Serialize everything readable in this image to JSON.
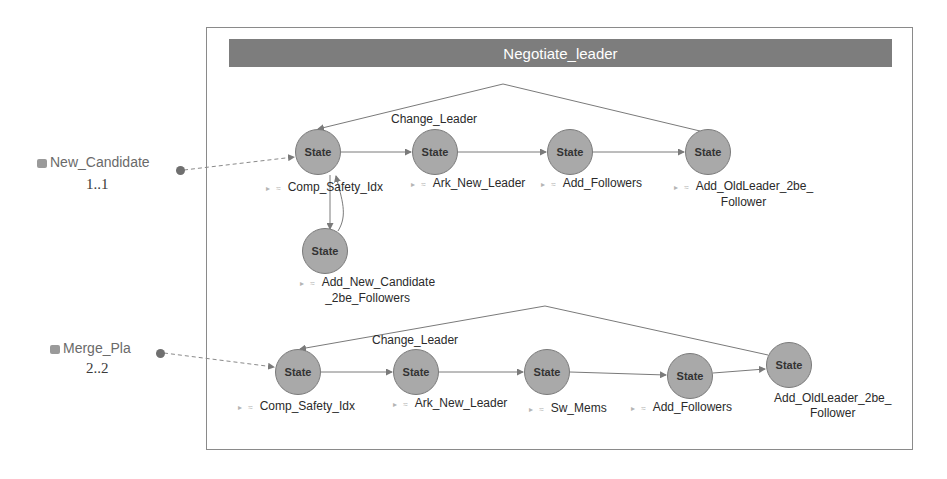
{
  "diagram": {
    "title": "Negotiate_leader",
    "colors": {
      "title_bar": "#7d7d7d",
      "state_fill": "#a9a9a9",
      "edge": "#7a7a7a",
      "frame": "#8a8a8a"
    },
    "ports": [
      {
        "name": "New_Candidate",
        "multiplicity": "1..1"
      },
      {
        "name": "Merge_Pla",
        "multiplicity": "2..2"
      }
    ],
    "top_row": {
      "edge_label": "Change_Leader",
      "states": [
        {
          "text": "State",
          "label": "Comp_Safety_Idx"
        },
        {
          "text": "State",
          "label": "Ark_New_Leader"
        },
        {
          "text": "State",
          "label": "Add_Followers"
        },
        {
          "text": "State",
          "label_line1": "Add_OldLeader_2be_",
          "label_line2": "Follower"
        },
        {
          "text": "State",
          "label_line1": "Add_New_Candidate",
          "label_line2": "_2be_Followers"
        }
      ]
    },
    "bottom_row": {
      "edge_label": "Change_Leader",
      "states": [
        {
          "text": "State",
          "label": "Comp_Safety_Idx"
        },
        {
          "text": "State",
          "label": "Ark_New_Leader"
        },
        {
          "text": "State",
          "label": "Sw_Mems"
        },
        {
          "text": "State",
          "label": "Add_Followers"
        },
        {
          "text": "State",
          "label_line1": "Add_OldLeader_2be_",
          "label_line2": "Follower"
        }
      ]
    },
    "marker": "▸ ≈"
  }
}
